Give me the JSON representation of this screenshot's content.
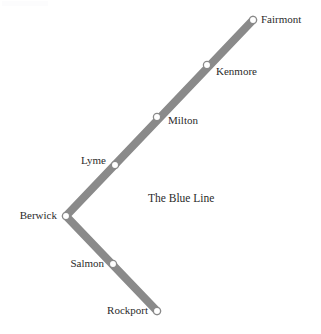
{
  "diagram": {
    "kind": "transit-line-map",
    "title": "The Blue Line",
    "title_position": {
      "x": 148,
      "y": 193
    },
    "canvas": {
      "width": 321,
      "height": 334
    },
    "colors": {
      "line": "#8a8a8a",
      "line_edge": "#7d7d7d",
      "marker_fill": "#ffffff",
      "marker_stroke": "#8a8a8a",
      "label_text": "#2b2b2b",
      "background": "#ffffff"
    },
    "line_width": 8,
    "marker_radius": 3.6
  },
  "route": {
    "name": "The Blue Line",
    "vertex_station": "Berwick",
    "branches": [
      {
        "name": "north-east-branch",
        "from": "Berwick",
        "to": "Fairmont",
        "stations": [
          "Berwick",
          "Lyme",
          "Milton",
          "Kenmore",
          "Fairmont"
        ]
      },
      {
        "name": "south-east-branch",
        "from": "Berwick",
        "to": "Rockport",
        "stations": [
          "Berwick",
          "Salmon",
          "Rockport"
        ]
      }
    ],
    "path_points": [
      {
        "x": 253,
        "y": 20
      },
      {
        "x": 66,
        "y": 216
      },
      {
        "x": 157,
        "y": 311
      }
    ]
  },
  "stations": [
    {
      "id": "fairmont",
      "name": "Fairmont",
      "marker": {
        "x": 253,
        "y": 20
      },
      "label": {
        "x": 261,
        "y": 14,
        "side": "right"
      },
      "terminus": true
    },
    {
      "id": "kenmore",
      "name": "Kenmore",
      "marker": {
        "x": 207,
        "y": 65
      },
      "label": {
        "x": 216,
        "y": 66,
        "side": "right"
      },
      "terminus": false
    },
    {
      "id": "milton",
      "name": "Milton",
      "marker": {
        "x": 157,
        "y": 117
      },
      "label": {
        "x": 168,
        "y": 115,
        "side": "right"
      },
      "terminus": false
    },
    {
      "id": "lyme",
      "name": "Lyme",
      "marker": {
        "x": 115,
        "y": 165
      },
      "label": {
        "x": 106,
        "y": 155,
        "side": "left"
      },
      "terminus": false
    },
    {
      "id": "berwick",
      "name": "Berwick",
      "marker": {
        "x": 66,
        "y": 216
      },
      "label": {
        "x": 57,
        "y": 210,
        "side": "left"
      },
      "terminus": false
    },
    {
      "id": "salmon",
      "name": "Salmon",
      "marker": {
        "x": 113,
        "y": 264
      },
      "label": {
        "x": 104,
        "y": 258,
        "side": "left"
      },
      "terminus": false
    },
    {
      "id": "rockport",
      "name": "Rockport",
      "marker": {
        "x": 157,
        "y": 311
      },
      "label": {
        "x": 148,
        "y": 305,
        "side": "left"
      },
      "terminus": true
    }
  ]
}
